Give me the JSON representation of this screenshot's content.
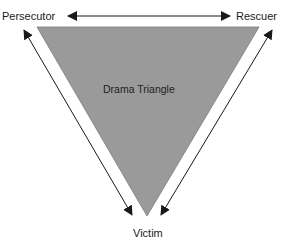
{
  "diagram": {
    "title": "Drama Triangle",
    "nodes": {
      "top_left": "Persecutor",
      "top_right": "Rescuer",
      "bottom": "Victim"
    },
    "edges": [
      {
        "from": "Persecutor",
        "to": "Rescuer",
        "type": "bidirectional"
      },
      {
        "from": "Persecutor",
        "to": "Victim",
        "type": "bidirectional"
      },
      {
        "from": "Rescuer",
        "to": "Victim",
        "type": "bidirectional"
      }
    ],
    "colors": {
      "triangle_fill": "#9a9a9a",
      "arrow": "#1a1a1a",
      "background": "#ffffff"
    }
  }
}
